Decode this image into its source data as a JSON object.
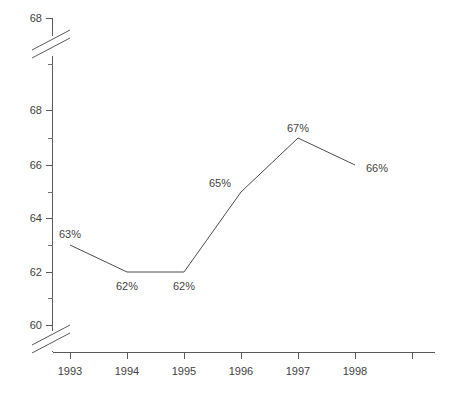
{
  "chart_data": {
    "type": "line",
    "title": "",
    "subtitle": "",
    "xlabel": "",
    "ylabel": "",
    "categories": [
      "1993",
      "1994",
      "1995",
      "1996",
      "1997",
      "1998"
    ],
    "values": [
      63,
      62,
      62,
      65,
      67,
      66
    ],
    "point_labels": [
      "63%",
      "62%",
      "62%",
      "65%",
      "67%",
      "66%"
    ],
    "series": [
      {
        "name": "",
        "values": [
          63,
          62,
          62,
          65,
          67,
          66
        ],
        "color": "#4d4d4d"
      }
    ],
    "ylim": [
      60,
      68
    ],
    "y_ticks": [
      60,
      62,
      64,
      66,
      68
    ],
    "y_tick_labels": [
      "60",
      "62",
      "64",
      "66",
      "68"
    ],
    "y_top_extra_label": "68",
    "y_minor_ticks": [
      61,
      63,
      65,
      67
    ],
    "x_ticks": [
      "1993",
      "1994",
      "1995",
      "1996",
      "1997",
      "1998",
      ""
    ],
    "axis_breaks": [
      "top",
      "bottom"
    ],
    "grid": false,
    "legend": "none",
    "line_color": "#4d4d4d",
    "axis_color": "#5a5a5a",
    "background_color": "#ffffff"
  },
  "axis": {
    "y_labels": [
      {
        "text": "68",
        "y": 18
      },
      {
        "text": "68",
        "y": 110
      },
      {
        "text": "66",
        "y": 165
      },
      {
        "text": "64",
        "y": 218
      },
      {
        "text": "62",
        "y": 272
      },
      {
        "text": "60",
        "y": 325
      }
    ],
    "x_labels": [
      {
        "text": "1993",
        "x": 70
      },
      {
        "text": "1994",
        "x": 127
      },
      {
        "text": "1995",
        "x": 184
      },
      {
        "text": "1996",
        "x": 241
      },
      {
        "text": "1997",
        "x": 298
      },
      {
        "text": "1998",
        "x": 355
      }
    ]
  },
  "points": [
    {
      "label": "63%",
      "x": 70,
      "y": 245,
      "lx": 70,
      "ly": 238,
      "anchor": "middle"
    },
    {
      "label": "62%",
      "x": 127,
      "y": 272,
      "lx": 127,
      "ly": 290,
      "anchor": "middle"
    },
    {
      "label": "62%",
      "x": 184,
      "y": 272,
      "lx": 184,
      "ly": 290,
      "anchor": "middle"
    },
    {
      "label": "65%",
      "x": 241,
      "y": 192,
      "lx": 229,
      "ly": 187,
      "anchor": "end"
    },
    {
      "label": "67%",
      "x": 298,
      "y": 138,
      "lx": 298,
      "ly": 132,
      "anchor": "middle"
    },
    {
      "label": "66%",
      "x": 355,
      "y": 165,
      "lx": 367,
      "ly": 170,
      "anchor": "start"
    }
  ]
}
